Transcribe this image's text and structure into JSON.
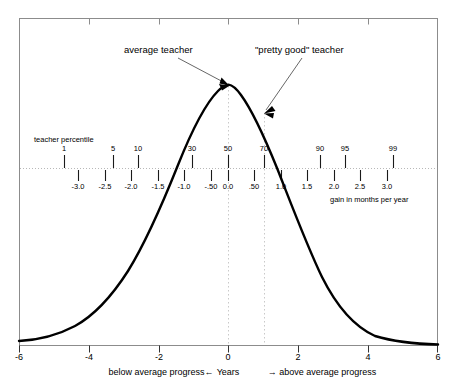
{
  "chart_data": {
    "type": "line",
    "title": "",
    "subtitle": "",
    "xlabel": "Years",
    "ylabel": "",
    "xlim": [
      -6,
      6
    ],
    "ylim": [
      0,
      1
    ],
    "grid": false,
    "legend": "none",
    "curve": {
      "name": "normal distribution of teacher effectiveness",
      "distribution": "normal",
      "mean": 0,
      "sd": 2,
      "description": "bell curve over Years axis from -6 to 6 peaking at 0"
    },
    "x_axis": {
      "label": "Years",
      "ticks": [
        -6,
        -4,
        -2,
        0,
        2,
        4,
        6
      ],
      "tick_labels": [
        "-6",
        "-4",
        "-2",
        "0",
        "2",
        "4",
        "6"
      ]
    },
    "secondary_axes": [
      {
        "name": "teacher percentile",
        "label": "teacher percentile",
        "ticks": [
          1,
          5,
          10,
          30,
          50,
          70,
          90,
          95,
          99
        ],
        "tick_labels": [
          "1",
          "5",
          "10",
          "30",
          "50",
          "70",
          "90",
          "95",
          "99"
        ],
        "positions_years": [
          -2.33,
          -1.645,
          -1.28,
          -0.52,
          0.0,
          0.52,
          1.28,
          1.645,
          2.33
        ]
      },
      {
        "name": "gain in months per year",
        "label": "gain in months per year",
        "ticks": [
          -3.0,
          -2.5,
          -2.0,
          -1.5,
          -1.0,
          -0.5,
          0.0,
          0.5,
          1.0,
          1.5,
          2.0,
          2.5,
          3.0
        ],
        "tick_labels": [
          "-3.0",
          "-2.5",
          "-2.0",
          "-1.5",
          "-1.0",
          "-.50",
          "0.0",
          ".50",
          "1.0",
          "1.5",
          "2.0",
          "2.5",
          "3.0"
        ]
      }
    ],
    "annotations": [
      {
        "name": "average-teacher",
        "text": "average teacher",
        "points_to_percentile": 50,
        "points_to_years": 0.0
      },
      {
        "name": "pretty-good-teacher",
        "text": "\"pretty good\" teacher",
        "points_to_percentile": 70,
        "points_to_years": 0.52
      }
    ],
    "reference_lines": [
      {
        "name": "percentile-50-line",
        "at_years": 0.0,
        "style": "dotted"
      },
      {
        "name": "percentile-70-line",
        "at_years": 0.52,
        "style": "dotted"
      },
      {
        "name": "baseline",
        "orientation": "horizontal",
        "style": "dotted"
      }
    ],
    "footnotes": {
      "left": "below average progress←",
      "center": "Years",
      "right": "→ above average progress"
    }
  },
  "labels": {
    "percentile_caption": "teacher percentile",
    "gain_caption": "gain in months per year",
    "annotation_average": "average teacher",
    "annotation_pretty_good": "\"pretty good\" teacher",
    "footer_left": "below average progress←",
    "footer_center": "Years",
    "footer_right": "→ above average progress"
  },
  "percentile_ticks": [
    {
      "label": "1",
      "x": 64
    },
    {
      "label": "5",
      "x": 113
    },
    {
      "label": "10",
      "x": 138
    },
    {
      "label": "30",
      "x": 192
    },
    {
      "label": "50",
      "x": 228
    },
    {
      "label": "70",
      "x": 264
    },
    {
      "label": "90",
      "x": 320
    },
    {
      "label": "95",
      "x": 345
    },
    {
      "label": "99",
      "x": 393
    }
  ],
  "gain_ticks": [
    {
      "label": "-3.0",
      "x": 78
    },
    {
      "label": "-2.5",
      "x": 105
    },
    {
      "label": "-2.0",
      "x": 131
    },
    {
      "label": "-1.5",
      "x": 158
    },
    {
      "label": "-1.0",
      "x": 184
    },
    {
      "label": "-.50",
      "x": 211
    },
    {
      "label": "0.0",
      "x": 228
    },
    {
      "label": ".50",
      "x": 254
    },
    {
      "label": "1.0",
      "x": 281
    },
    {
      "label": "1.5",
      "x": 307
    },
    {
      "label": "2.0",
      "x": 334
    },
    {
      "label": "2.5",
      "x": 360
    },
    {
      "label": "3.0",
      "x": 387
    }
  ],
  "axis_ticks": [
    {
      "label": "-6",
      "x": 19
    },
    {
      "label": "-4",
      "x": 89
    },
    {
      "label": "-2",
      "x": 159
    },
    {
      "label": "0",
      "x": 228
    },
    {
      "label": "2",
      "x": 298
    },
    {
      "label": "4",
      "x": 368
    },
    {
      "label": "6",
      "x": 438
    }
  ],
  "colors": {
    "curve": "#000000",
    "frame": "#808080",
    "dotted": "#bfbfbf",
    "text": "#000000",
    "leader": "#555555",
    "background": "#ffffff"
  }
}
